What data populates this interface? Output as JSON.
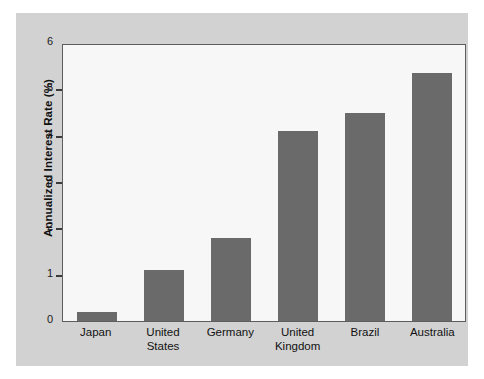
{
  "chart_data": {
    "type": "bar",
    "title": "",
    "xlabel": "",
    "ylabel": "Annualized Interest Rate (%)",
    "categories": [
      "Japan",
      "United States",
      "Germany",
      "United Kingdom",
      "Brazil",
      "Australia"
    ],
    "category_lines": [
      [
        "Japan"
      ],
      [
        "United",
        "States"
      ],
      [
        "Germany"
      ],
      [
        "United",
        "Kingdom"
      ],
      [
        "Brazil"
      ],
      [
        "Australia"
      ]
    ],
    "values": [
      0.2,
      1.1,
      1.8,
      4.1,
      4.5,
      5.35
    ],
    "ylim": [
      0,
      6
    ],
    "yticks": [
      0,
      1,
      2,
      3,
      4,
      5,
      6
    ],
    "ytick_labels": [
      "0",
      "1",
      "2",
      "3",
      "4",
      "5",
      "6"
    ],
    "grid": false,
    "legend": null,
    "bar_color": "#6a6a6a",
    "plot_background": "#f7f7f7",
    "figure_background": "#d2d2d2",
    "axis_color": "#5d5d5d"
  }
}
